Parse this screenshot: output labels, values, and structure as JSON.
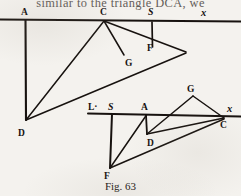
{
  "page": {
    "running_text": "similar to the triangle DCA, we",
    "caption": "Fig. 63",
    "ink_color": "#17120f",
    "paper_color": "#f4f2ee"
  },
  "figures": [
    {
      "id": "upper-figure",
      "name": "upper-geometric-construction",
      "baseline": {
        "x1": 0,
        "y1": 19,
        "x2": 241,
        "y2": 21
      },
      "vertices": [
        {
          "name": "A",
          "label": "A",
          "style": "roman",
          "px": 25,
          "py": 20,
          "lx": 22,
          "ly": 14
        },
        {
          "name": "C",
          "label": "C",
          "style": "roman",
          "px": 104,
          "py": 21,
          "lx": 100,
          "ly": 14
        },
        {
          "name": "S",
          "label": "S",
          "style": "italic",
          "px": 152,
          "py": 22,
          "lx": 148,
          "ly": 14
        },
        {
          "name": "X",
          "label": "x",
          "style": "italic-x",
          "px": 205,
          "py": 23,
          "lx": 201,
          "ly": 15
        },
        {
          "name": "D",
          "label": "D",
          "style": "roman",
          "px": 26,
          "py": 120,
          "lx": 20,
          "ly": 133
        },
        {
          "name": "G",
          "label": "G",
          "style": "roman",
          "px": 124,
          "py": 53,
          "lx": 126,
          "ly": 64
        },
        {
          "name": "F",
          "label": "F",
          "style": "roman",
          "px": 152,
          "py": 44,
          "lx": 148,
          "ly": 50
        }
      ],
      "segments": [
        {
          "from": "A",
          "to": "D",
          "name": "segment-A-D"
        },
        {
          "from": "C",
          "to": "D",
          "name": "segment-C-D"
        },
        {
          "from": "C",
          "to": "G",
          "name": "segment-C-G"
        },
        {
          "from": "S",
          "to": "F",
          "name": "segment-S-F"
        },
        {
          "from": "D",
          "to": "Fline",
          "name": "segment-D-through-F"
        },
        {
          "from": "C",
          "to": "Fline",
          "name": "segment-C-through-F"
        }
      ]
    },
    {
      "id": "lower-figure",
      "name": "lower-geometric-construction",
      "baseline": {
        "x1": 88,
        "y1": 113,
        "x2": 241,
        "y2": 116
      },
      "vertices": [
        {
          "name": "L",
          "label": "L·",
          "style": "roman",
          "px": 95,
          "py": 113,
          "lx": 90,
          "ly": 108
        },
        {
          "name": "S",
          "label": "S",
          "style": "italic",
          "px": 113,
          "py": 114,
          "lx": 110,
          "ly": 108
        },
        {
          "name": "A",
          "label": "A",
          "style": "roman",
          "px": 146,
          "py": 115,
          "lx": 142,
          "ly": 108
        },
        {
          "name": "X",
          "label": "x",
          "style": "italic-x",
          "px": 232,
          "py": 116,
          "lx": 228,
          "ly": 110
        },
        {
          "name": "C",
          "label": "C",
          "style": "roman",
          "px": 224,
          "py": 119,
          "lx": 222,
          "ly": 127
        },
        {
          "name": "G",
          "label": "G",
          "style": "roman",
          "px": 192,
          "py": 94,
          "lx": 188,
          "ly": 89
        },
        {
          "name": "D",
          "label": "D",
          "style": "roman",
          "px": 147,
          "py": 133,
          "lx": 148,
          "ly": 144
        },
        {
          "name": "F",
          "label": "F",
          "style": "roman",
          "px": 110,
          "py": 168,
          "lx": 106,
          "ly": 177
        }
      ],
      "segments": [
        {
          "from": "S",
          "to": "F",
          "name": "segment-S-F"
        },
        {
          "from": "A",
          "to": "D",
          "name": "segment-A-D"
        },
        {
          "from": "F",
          "to": "A",
          "name": "segment-F-A"
        },
        {
          "from": "F",
          "to": "C",
          "name": "segment-F-C"
        },
        {
          "from": "D",
          "to": "C",
          "name": "segment-D-C"
        },
        {
          "from": "C",
          "to": "G",
          "name": "segment-C-G"
        },
        {
          "from": "G",
          "to": "D",
          "name": "segment-G-D"
        }
      ]
    }
  ]
}
